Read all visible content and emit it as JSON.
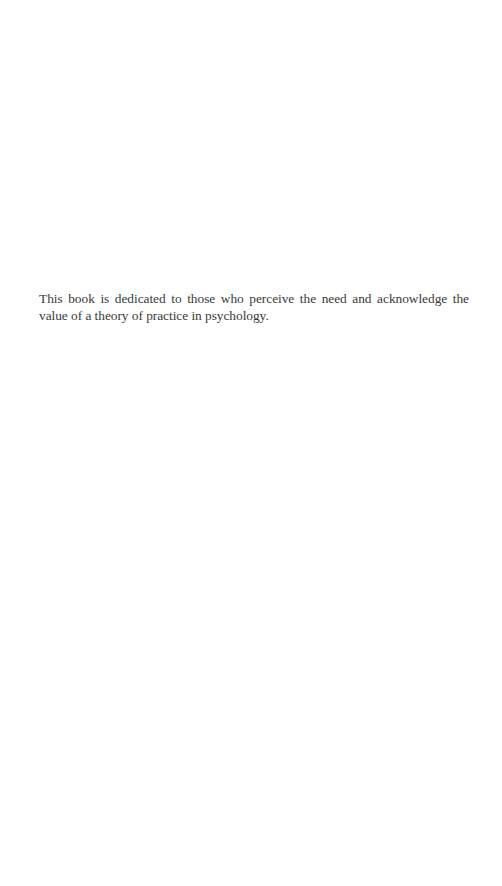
{
  "page": {
    "dedication": {
      "text": "This book is dedicated to those who perceive the need and acknowledge the value of a theory of practice in psychology."
    }
  }
}
